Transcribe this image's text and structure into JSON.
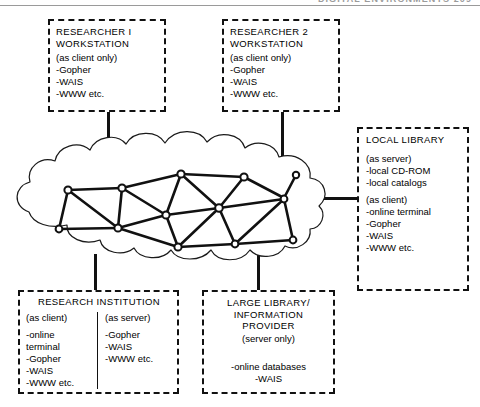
{
  "page_header": {
    "text": "DIGITAL ENVIRONMENTS  209"
  },
  "figure": {
    "cloud_label": "network-cloud",
    "nodes_count": 13
  },
  "boxes": {
    "researcher1": {
      "title": "RESEARCHER I\nWORKSTATION",
      "role": "(as client only)",
      "items": "-Gopher\n-WAIS\n-WWW etc."
    },
    "researcher2": {
      "title": "RESEARCHER 2\nWORKSTATION",
      "role": "(as client only)",
      "items": "-Gopher\n-WAIS\n-WWW etc."
    },
    "local_library": {
      "title": "LOCAL LIBRARY",
      "server_role": "(as server)",
      "server_items": "-local CD-ROM\n-local catalogs",
      "client_role": "(as client)",
      "client_items": "-online terminal\n-Gopher\n-WAIS\n-WWW etc."
    },
    "research_institution": {
      "title": "RESEARCH INSTITUTION",
      "client_role": "(as client)",
      "client_items": "-online\n terminal\n-Gopher\n-WAIS\n-WWW etc.",
      "server_role": "(as server)",
      "server_items": "-Gopher\n-WAIS\n-WWW etc."
    },
    "large_library": {
      "title": "LARGE LIBRARY/\nINFORMATION\nPROVIDER",
      "role": "(server only)",
      "items": "-online databases\n-WAIS"
    }
  },
  "colors": {
    "ink": "#111111",
    "header_rule": "#9a9a9a",
    "background": "#ffffff"
  }
}
